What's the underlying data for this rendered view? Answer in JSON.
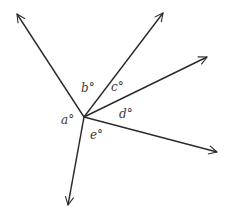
{
  "diagram": {
    "type": "angles-around-point",
    "vertex": {
      "x": 84,
      "y": 117
    },
    "stroke_color": "#2a2a2a",
    "rays": [
      {
        "id": "ray-upper-left",
        "x2": 17,
        "y2": 14
      },
      {
        "id": "ray-upper-right",
        "x2": 163,
        "y2": 13
      },
      {
        "id": "ray-right-upper",
        "x2": 207,
        "y2": 57
      },
      {
        "id": "ray-right-lower",
        "x2": 217,
        "y2": 152
      },
      {
        "id": "ray-down",
        "x2": 68,
        "y2": 205
      }
    ],
    "angle_labels": [
      {
        "id": "a",
        "text": "a°",
        "x": 61,
        "y": 114
      },
      {
        "id": "b",
        "text": "b°",
        "x": 81,
        "y": 82
      },
      {
        "id": "c",
        "text": "c°",
        "x": 111,
        "y": 81
      },
      {
        "id": "d",
        "text": "d°",
        "x": 119,
        "y": 108
      },
      {
        "id": "e",
        "text": "e°",
        "x": 90,
        "y": 129
      }
    ]
  }
}
